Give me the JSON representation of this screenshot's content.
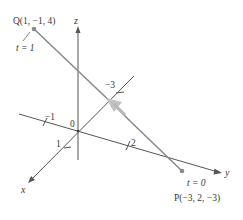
{
  "diagram": {
    "type": "3d-line-segment",
    "axes": {
      "x": {
        "label": "x"
      },
      "y": {
        "label": "y"
      },
      "z": {
        "label": "z"
      },
      "origin_label": "0"
    },
    "ticks": {
      "x_pos_1": "1",
      "x_neg_3": "−3",
      "y_neg_1": "−1",
      "y_pos_2": "2"
    },
    "points": {
      "Q": {
        "label": "Q(1, −1, 4)",
        "param": "t = 1"
      },
      "P": {
        "label": "P(−3, 2, −3)",
        "param": "t = 0"
      }
    },
    "colors": {
      "axis": "#555555",
      "segment": "#8a8a8a",
      "arrow": "#b8b8b8",
      "point": "#8a8a8a",
      "text": "#3a3a3a"
    }
  }
}
